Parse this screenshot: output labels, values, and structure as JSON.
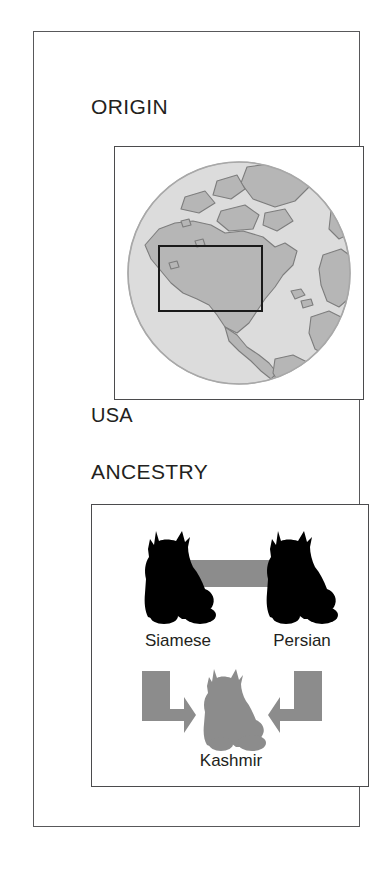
{
  "card": {
    "sections": [
      {
        "id": "origin",
        "title": "ORIGIN",
        "caption": "USA",
        "map": {
          "type": "globe",
          "icon": "globe-icon",
          "view": "North America / Atlantic hemisphere",
          "highlight_region": "USA",
          "highlight_style": "black rectangle outline"
        }
      },
      {
        "id": "ancestry",
        "title": "ANCESTRY",
        "parents": [
          {
            "name": "Siamese",
            "icon": "cat-silhouette-icon",
            "color": "#000000"
          },
          {
            "name": "Persian",
            "icon": "cat-silhouette-icon",
            "color": "#000000"
          }
        ],
        "link_label": "",
        "offspring": {
          "name": "Kashmir",
          "icon": "cat-silhouette-icon",
          "color": "#8c8c8c"
        },
        "arrows": [
          {
            "direction": "right",
            "icon": "arrow-right-icon"
          },
          {
            "direction": "left",
            "icon": "arrow-left-icon"
          }
        ]
      }
    ]
  },
  "colors": {
    "frame": "#4b4b4d",
    "outer_frame": "#58585a",
    "text": "#231f20",
    "accent_gray": "#8c8c8c",
    "silhouette": "#000000",
    "globe_land": "#b0b0b0",
    "globe_ocean": "#d8d8d8",
    "background": "#ffffff"
  }
}
